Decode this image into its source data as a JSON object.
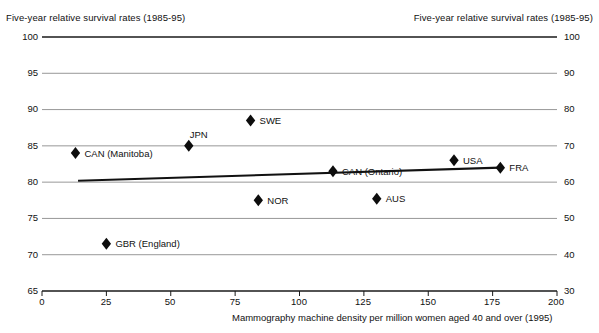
{
  "chart_data": {
    "type": "scatter",
    "title": "",
    "xlabel": "Mammography machine density per million women aged 40 and over (1995)",
    "ylabel_left": "Five-year relative survival rates (1985-95)",
    "ylabel_right": "Five-year relative survival rates (1985-95)",
    "xlim": [
      0,
      200
    ],
    "xticks": [
      0,
      25,
      50,
      75,
      100,
      125,
      150,
      175,
      200
    ],
    "ylim_left": [
      65,
      100
    ],
    "yticks_left": [
      65,
      70,
      75,
      80,
      85,
      90,
      95,
      100
    ],
    "ylim_right": [
      30,
      100
    ],
    "yticks_right": [
      30,
      40,
      50,
      60,
      70,
      80,
      90,
      100
    ],
    "grid": true,
    "legend": "none",
    "points": [
      {
        "label": "CAN (Manitoba)",
        "x": 13,
        "y": 84.0,
        "label_side": "right"
      },
      {
        "label": "GBR (England)",
        "x": 25,
        "y": 71.5,
        "label_side": "right"
      },
      {
        "label": "JPN",
        "x": 57,
        "y": 85.0,
        "label_side": "above-right"
      },
      {
        "label": "SWE",
        "x": 81,
        "y": 88.5,
        "label_side": "right"
      },
      {
        "label": "NOR",
        "x": 84,
        "y": 77.5,
        "label_side": "right"
      },
      {
        "label": "CAN (Ontario)",
        "x": 113,
        "y": 81.5,
        "label_side": "right"
      },
      {
        "label": "AUS",
        "x": 130,
        "y": 77.7,
        "label_side": "right"
      },
      {
        "label": "USA",
        "x": 160,
        "y": 83.0,
        "label_side": "right"
      },
      {
        "label": "FRA",
        "x": 178,
        "y": 82.0,
        "label_side": "right"
      }
    ],
    "trendline": {
      "x0": 14,
      "y0": 80.2,
      "x1": 178,
      "y1": 82.0
    }
  },
  "axes": {
    "left_title": "Five-year relative survival rates (1985-95)",
    "right_title": "Five-year relative survival rates (1985-95)",
    "x_caption": "Mammography machine density per million women aged 40 and over (1995)",
    "y_left_ticks": [
      "100",
      "95",
      "90",
      "85",
      "80",
      "75",
      "70",
      "65"
    ],
    "y_right_ticks": [
      "100",
      "90",
      "80",
      "70",
      "60",
      "50",
      "40",
      "30"
    ],
    "x_ticks": [
      "0",
      "25",
      "50",
      "75",
      "100",
      "125",
      "150",
      "175",
      "200"
    ]
  },
  "colors": {
    "marker": "#0d0d0d",
    "gridline": "#8c8c8c",
    "axis": "#1a1a1a",
    "trendline": "#111111",
    "background": "#ffffff",
    "text": "#111111"
  }
}
